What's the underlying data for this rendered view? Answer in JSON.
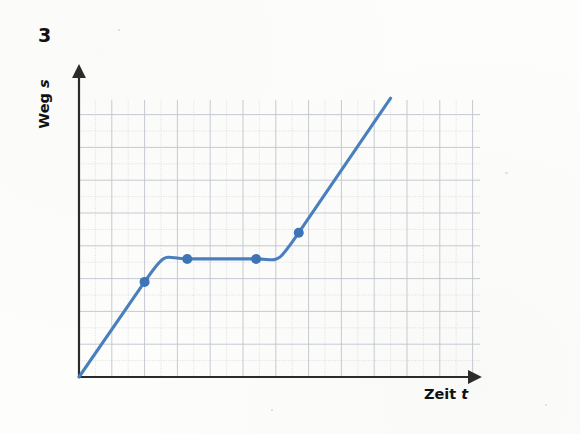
{
  "figure": {
    "exercise_number": "3",
    "y_axis_label_text": "Weg ",
    "y_axis_label_symbol": "s",
    "x_axis_label_text": "Zeit ",
    "x_axis_label_symbol": "t"
  },
  "colors": {
    "curve": "#4a7fbd",
    "marker": "#3d74b5",
    "axis": "#2b2b2b",
    "grid_major": "#c3c7cf",
    "grid_minor": "#d9dde3",
    "paper": "#fdfdfc"
  },
  "chart_data": {
    "type": "line",
    "title": "",
    "xlabel": "Zeit t",
    "ylabel": "Weg s",
    "grid": true,
    "legend": "none",
    "axis_arrows": true,
    "axis_ticks_labeled": false,
    "xlim": [
      0,
      12
    ],
    "ylim": [
      0,
      9
    ],
    "series": [
      {
        "name": "Weg s(t)",
        "color": "#4a7fbd",
        "x": [
          0.0,
          2.0,
          3.3,
          5.4,
          6.7,
          9.5
        ],
        "y": [
          0.0,
          2.9,
          3.6,
          3.6,
          4.4,
          8.5
        ],
        "segments": [
          {
            "label": "gleichfoermige Bewegung",
            "shape": "straight",
            "from": 0,
            "to": 1
          },
          {
            "label": "Abbremsen",
            "shape": "curved",
            "from": 1,
            "to": 2
          },
          {
            "label": "Stillstand",
            "shape": "straight",
            "from": 2,
            "to": 3
          },
          {
            "label": "Beschleunigen",
            "shape": "curved",
            "from": 3,
            "to": 4
          },
          {
            "label": "gleichfoermige Bewegung",
            "shape": "straight",
            "from": 4,
            "to": 5
          }
        ]
      }
    ],
    "markers": {
      "shape": "circle",
      "radius_px": 5,
      "points": [
        {
          "x": 2.0,
          "y": 2.9
        },
        {
          "x": 3.3,
          "y": 3.6
        },
        {
          "x": 5.4,
          "y": 3.6
        },
        {
          "x": 6.7,
          "y": 4.4
        }
      ]
    }
  }
}
